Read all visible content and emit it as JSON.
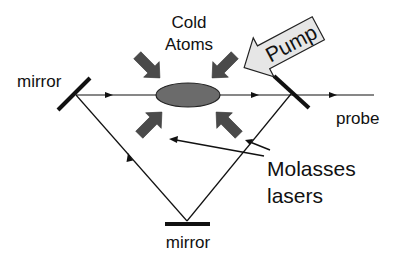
{
  "diagram": {
    "labels": {
      "cold_atoms_line1": "Cold",
      "cold_atoms_line2": "Atoms",
      "pump": "Pump",
      "mirror_left": "mirror",
      "mirror_bottom": "mirror",
      "probe": "probe",
      "molasses_line1": "Molasses",
      "molasses_line2": "lasers"
    },
    "colors": {
      "line": "#111111",
      "atom_cloud": "#6b6b6b",
      "molasses_arrow": "#4a4a4a",
      "pump_fill": "#e6e6e6",
      "pump_stroke": "#222222",
      "background": "#ffffff"
    },
    "elements": [
      {
        "id": "mirror-left",
        "type": "mirror",
        "label": "mirror"
      },
      {
        "id": "mirror-right",
        "type": "mirror (output coupler)"
      },
      {
        "id": "mirror-bottom",
        "type": "mirror",
        "label": "mirror"
      },
      {
        "id": "atom-cloud",
        "type": "ellipse",
        "label": "Cold Atoms"
      },
      {
        "id": "pump-arrow",
        "type": "arrow",
        "label": "Pump"
      },
      {
        "id": "molasses-arrows",
        "type": "arrow x4",
        "label": "Molasses lasers"
      },
      {
        "id": "probe-beam",
        "type": "beam",
        "label": "probe"
      }
    ]
  }
}
